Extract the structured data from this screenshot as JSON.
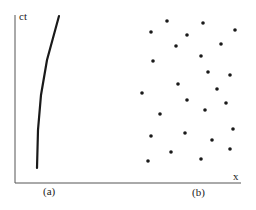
{
  "figure": {
    "axis_labels": {
      "y": "ct",
      "x": "x"
    },
    "panel_labels": [
      "(a)",
      "(b)"
    ],
    "colors": {
      "ink": "#1a1a1a",
      "axis": "#444444",
      "background": "#ffffff"
    }
  },
  "panel_a": {
    "description": "single worldline curve",
    "curve_points": [
      [
        37,
        168
      ],
      [
        38,
        130
      ],
      [
        41,
        95
      ],
      [
        47,
        60
      ],
      [
        53,
        38
      ],
      [
        59,
        16
      ]
    ]
  },
  "panel_b": {
    "description": "scattered dots",
    "dots": [
      [
        167,
        21
      ],
      [
        203,
        23
      ],
      [
        151,
        32
      ],
      [
        235,
        30
      ],
      [
        187,
        35
      ],
      [
        176,
        46
      ],
      [
        221,
        44
      ],
      [
        153,
        61
      ],
      [
        201,
        56
      ],
      [
        208,
        72
      ],
      [
        230,
        75
      ],
      [
        178,
        84
      ],
      [
        217,
        89
      ],
      [
        142,
        93
      ],
      [
        187,
        100
      ],
      [
        226,
        103
      ],
      [
        160,
        114
      ],
      [
        205,
        110
      ],
      [
        185,
        133
      ],
      [
        233,
        129
      ],
      [
        151,
        136
      ],
      [
        212,
        140
      ],
      [
        171,
        152
      ],
      [
        230,
        149
      ],
      [
        148,
        161
      ],
      [
        201,
        159
      ]
    ]
  }
}
